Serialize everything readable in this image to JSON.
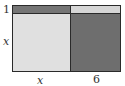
{
  "diagram": {
    "type": "area-model",
    "labels": {
      "row_top": "1",
      "row_bottom": "x",
      "col_left": "x",
      "col_right": "6"
    },
    "cells": [
      {
        "name": "top-left",
        "row": "1",
        "col": "x",
        "color": "#757575"
      },
      {
        "name": "top-right",
        "row": "1",
        "col": "6",
        "color": "#d6d6d6"
      },
      {
        "name": "bottom-left",
        "row": "x",
        "col": "x",
        "color": "#e0e0e0"
      },
      {
        "name": "bottom-right",
        "row": "x",
        "col": "6",
        "color": "#6e6e6e"
      }
    ]
  }
}
